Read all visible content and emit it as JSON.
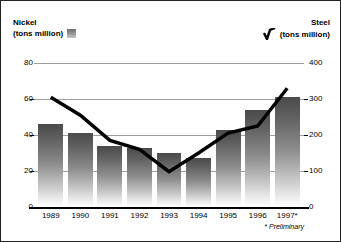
{
  "legend": {
    "left": {
      "title": "Nickel",
      "units": "(tons million)",
      "swatch_icon": "bar-swatch-icon",
      "color": "#6e6e6e"
    },
    "right": {
      "title": "Steel",
      "units": "(tons million)",
      "swatch_icon": "line-swatch-icon",
      "color": "#000000"
    }
  },
  "footnote": "* Preliminary",
  "chart_data": {
    "type": "bar",
    "title": "",
    "subtitle": "",
    "xlabel": "",
    "ylabel": "Nickel (tons million)",
    "y2label": "Steel (tons million)",
    "grid": true,
    "legend_position": "top",
    "categories": [
      "1989",
      "1990",
      "1991",
      "1992",
      "1993",
      "1994",
      "1995",
      "1996",
      "1997*"
    ],
    "ylim": [
      0,
      80
    ],
    "yticks": [
      0,
      20,
      40,
      60,
      80
    ],
    "ytick_labels": [
      "0",
      "20",
      "40",
      "60",
      "80"
    ],
    "y2lim": [
      0,
      400
    ],
    "y2ticks": [
      0,
      100,
      200,
      300,
      400
    ],
    "y2tick_labels": [
      "0",
      "100",
      "200",
      "300",
      "400"
    ],
    "series": [
      {
        "name": "Nickel",
        "type": "bar",
        "axis": "left",
        "units": "tons million",
        "color": "#6e6e6e",
        "values": [
          46,
          41,
          34,
          33,
          30,
          27,
          43,
          54,
          61
        ]
      },
      {
        "name": "Steel",
        "type": "line",
        "axis": "right",
        "units": "tons million",
        "color": "#000000",
        "values": [
          305,
          255,
          185,
          160,
          98,
          150,
          205,
          225,
          330
        ]
      }
    ]
  }
}
